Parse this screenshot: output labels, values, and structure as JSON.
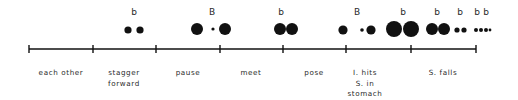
{
  "diagram": {
    "colors": {
      "ink": "#111111",
      "text": "#2a2a2a",
      "background": "#ffffff"
    },
    "axis": {
      "y": 49,
      "x_start": 29,
      "x_end": 476,
      "tick_height": 8
    },
    "ticks": [
      29,
      93,
      156,
      220,
      283,
      346,
      411,
      476
    ],
    "labels": [
      {
        "x": 61,
        "lines": [
          "each other"
        ]
      },
      {
        "x": 124,
        "lines": [
          "stagger",
          "forward"
        ]
      },
      {
        "x": 188,
        "lines": [
          "pause"
        ]
      },
      {
        "x": 251,
        "lines": [
          "meet"
        ]
      },
      {
        "x": 314,
        "lines": [
          "pose"
        ]
      },
      {
        "x": 365,
        "lines": [
          "I. hits",
          "S. in",
          "stomach"
        ]
      },
      {
        "x": 443,
        "lines": [
          "S. falls"
        ]
      }
    ],
    "markers": [
      {
        "x": 134,
        "text": "b"
      },
      {
        "x": 212,
        "text": "B"
      },
      {
        "x": 281,
        "text": "b"
      },
      {
        "x": 357,
        "text": "B"
      },
      {
        "x": 403,
        "text": "b"
      },
      {
        "x": 437,
        "text": "b"
      },
      {
        "x": 460,
        "text": "b"
      },
      {
        "x": 477,
        "text": "b"
      },
      {
        "x": 486,
        "text": "b"
      }
    ],
    "dots": [
      {
        "x": 128,
        "y": 30,
        "r": 3.6
      },
      {
        "x": 140,
        "y": 30,
        "r": 3.6
      },
      {
        "x": 197,
        "y": 29,
        "r": 6
      },
      {
        "x": 213,
        "y": 29,
        "r": 1.6
      },
      {
        "x": 225,
        "y": 29,
        "r": 6
      },
      {
        "x": 280,
        "y": 29,
        "r": 6
      },
      {
        "x": 292,
        "y": 29,
        "r": 6
      },
      {
        "x": 343,
        "y": 30,
        "r": 4.6
      },
      {
        "x": 362,
        "y": 30,
        "r": 1.8
      },
      {
        "x": 371,
        "y": 30,
        "r": 4.6
      },
      {
        "x": 394,
        "y": 29,
        "r": 8
      },
      {
        "x": 411,
        "y": 29,
        "r": 8
      },
      {
        "x": 432,
        "y": 29,
        "r": 6
      },
      {
        "x": 444,
        "y": 29,
        "r": 6
      },
      {
        "x": 457,
        "y": 30,
        "r": 2.6
      },
      {
        "x": 464,
        "y": 30,
        "r": 2.6
      },
      {
        "x": 476,
        "y": 30,
        "r": 2
      },
      {
        "x": 481,
        "y": 30,
        "r": 2
      },
      {
        "x": 486,
        "y": 30,
        "r": 2
      },
      {
        "x": 490,
        "y": 30,
        "r": 1.4
      }
    ]
  }
}
